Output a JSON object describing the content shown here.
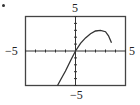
{
  "chart_data": {
    "type": "line",
    "title": "",
    "xlabel": "",
    "ylabel": "",
    "xlim": [
      -5,
      5
    ],
    "ylim": [
      -5,
      5
    ],
    "grid": false,
    "legend": null,
    "tick_labels": {
      "x_min": "−5",
      "x_max": "5",
      "y_min": "−5",
      "y_max": "5"
    },
    "x_ticks": [
      -5,
      -4,
      -3,
      -2,
      -1,
      0,
      1,
      2,
      3,
      4,
      5
    ],
    "y_ticks": [
      -5,
      -4,
      -3,
      -2,
      -1,
      0,
      1,
      2,
      3,
      4,
      5
    ],
    "series": [
      {
        "name": "curve",
        "x": [
          -1.8,
          -1.5,
          -1.0,
          -0.5,
          0,
          0.5,
          1.0,
          1.5,
          2.0,
          2.5,
          3.0,
          3.3,
          3.6
        ],
        "y": [
          -5.0,
          -4.2,
          -2.9,
          -1.4,
          0,
          1.1,
          1.9,
          2.5,
          2.9,
          3.0,
          2.8,
          2.2,
          1.2
        ]
      }
    ]
  },
  "labels": {
    "top": "5",
    "bottom": "−5",
    "left": "−5",
    "right": "5"
  }
}
